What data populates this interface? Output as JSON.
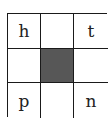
{
  "grid": {
    "rows": 3,
    "cols": 3,
    "fill_color": "#575757",
    "cells": [
      {
        "label": "h",
        "filled": false
      },
      {
        "label": "",
        "filled": false
      },
      {
        "label": "t",
        "filled": false
      },
      {
        "label": "",
        "filled": false
      },
      {
        "label": "",
        "filled": true
      },
      {
        "label": "",
        "filled": false
      },
      {
        "label": "p",
        "filled": false
      },
      {
        "label": "",
        "filled": false
      },
      {
        "label": "n",
        "filled": false
      }
    ]
  }
}
